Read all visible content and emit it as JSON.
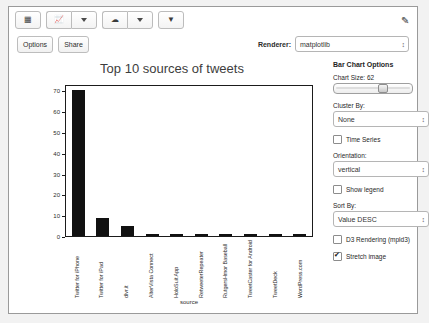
{
  "toolbar": {
    "grid_icon": "grid-icon",
    "chart_icon": "line-chart-icon",
    "cloud_icon": "cloud-icon",
    "filter_icon": "filter-icon",
    "edit_icon": "pencil-icon"
  },
  "subbar": {
    "options_label": "Options",
    "share_label": "Share",
    "renderer_label": "Renderer:",
    "renderer_value": "matplotlib"
  },
  "panel": {
    "title": "Bar Chart Options",
    "chart_size_label": "Chart Size: 62",
    "chart_size_value": 62,
    "cluster_by_label": "Cluster By:",
    "cluster_by_value": "None",
    "time_series_label": "Time Series",
    "time_series_checked": false,
    "orientation_label": "Orientation:",
    "orientation_value": "vertical",
    "show_legend_label": "Show legend",
    "show_legend_checked": false,
    "sort_by_label": "Sort By:",
    "sort_by_value": "Value DESC",
    "d3_label": "D3 Rendering (mpld3)",
    "d3_checked": false,
    "stretch_label": "Stretch image",
    "stretch_checked": true
  },
  "chart_data": {
    "type": "bar",
    "title": "Top 10 sources of tweets",
    "xlabel": "source",
    "ylabel": "",
    "grid": false,
    "legend": false,
    "ylim": [
      0,
      73
    ],
    "yticks": [
      70,
      60,
      50,
      40,
      30,
      20,
      10,
      0
    ],
    "categories": [
      "Twitter for iPhone",
      "Twitter for iPad",
      "dlvr.it",
      "AlterVista Connect",
      "HoloSuit App",
      "RetweeterRepeater",
      "RutgersHmor Baseball",
      "TweetCaster for Android",
      "TweetDeck",
      "WordPress.com"
    ],
    "values": [
      71,
      9,
      5,
      1,
      1,
      1,
      1,
      1,
      1,
      1
    ],
    "bar_color": "#111111"
  }
}
